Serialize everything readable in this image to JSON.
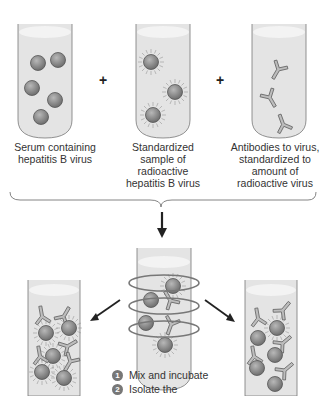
{
  "tubes_top": [
    {
      "id": "serum",
      "label": "Serum containing hepatitis B virus"
    },
    {
      "id": "radioactive",
      "label": "Standardized sample of radioactive hepatitis B virus"
    },
    {
      "id": "antibodies",
      "label": "Antibodies to virus, standardized to amount of radioactive virus"
    }
  ],
  "operators": [
    "+",
    "+"
  ],
  "steps": [
    {
      "number": "1",
      "text": "Mix and incubate"
    },
    {
      "number": "2",
      "text": "Isolate the"
    }
  ],
  "colors": {
    "tube_fill": "#e4e4e4",
    "tube_top": "#f2f2f2",
    "virus": "#8a8a8a",
    "outline": "#555555",
    "arrow": "#222222"
  }
}
